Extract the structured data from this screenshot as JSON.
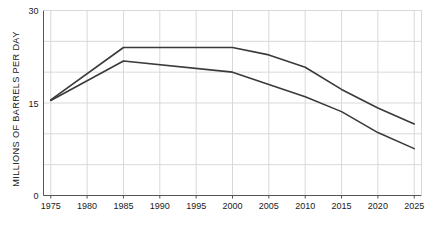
{
  "chart_data": {
    "type": "line",
    "title": "",
    "xlabel": "",
    "ylabel": "MILLIONS OF BARRELS PER DAY",
    "xlim": [
      1974,
      2026
    ],
    "ylim": [
      0,
      30
    ],
    "xticks": [
      1975,
      1980,
      1985,
      1990,
      1995,
      2000,
      2005,
      2010,
      2015,
      2020,
      2025
    ],
    "xticklabels": [
      "1975",
      "1980",
      "1985",
      "1990",
      "1995",
      "2000",
      "2005",
      "2010",
      "2015",
      "2020",
      "2025"
    ],
    "yticks": [
      0,
      15,
      30
    ],
    "yticklabels": [
      "0",
      "15",
      "30"
    ],
    "gridlines_y": [
      0,
      5,
      10,
      15,
      20,
      25,
      30
    ],
    "grid": true,
    "legend": "none",
    "x": [
      1975,
      1985,
      2000,
      2005,
      2010,
      2015,
      2020,
      2025
    ],
    "series": [
      {
        "name": "upper-line",
        "values": [
          15.5,
          24.0,
          24.0,
          22.8,
          20.8,
          17.2,
          14.2,
          11.6
        ]
      },
      {
        "name": "lower-line",
        "values": [
          15.4,
          21.8,
          20.0,
          18.0,
          16.0,
          13.6,
          10.2,
          7.6
        ]
      }
    ],
    "line_color": "#3a3a3a",
    "grid_color": "#d9d9d9",
    "axis_color": "#555555"
  }
}
